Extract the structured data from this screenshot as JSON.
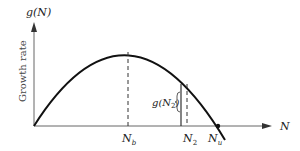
{
  "diagram": {
    "y_axis_label": "g(N)",
    "y_axis_title": "Growth rate",
    "x_axis_label": "N",
    "markers": {
      "n_b": {
        "base": "N",
        "sub": "b"
      },
      "n_2": {
        "base": "N",
        "sub": "2"
      },
      "n_u": {
        "base": "N",
        "sub": "u"
      }
    },
    "bracket_label": {
      "prefix": "g(N",
      "sub": "2",
      "suffix": ")"
    },
    "colors": {
      "curve": "#111111",
      "axes": "#777777"
    }
  }
}
